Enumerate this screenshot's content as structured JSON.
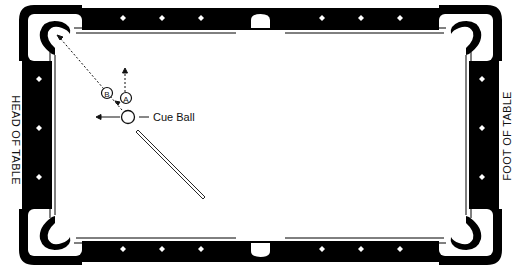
{
  "diagram": {
    "labels": {
      "head": "HEAD OF TABLE",
      "foot": "FOOT OF TABLE",
      "cue_ball": "Cue Ball",
      "point_a": "A",
      "point_b": "B"
    },
    "colors": {
      "rail": "#000000",
      "cloth": "#ffffff",
      "line": "#111111"
    },
    "diamonds": {
      "top": [
        123,
        162,
        201,
        322,
        361,
        400
      ],
      "bottom": [
        123,
        162,
        201,
        322,
        361,
        400
      ],
      "left": [
        79,
        128,
        177
      ],
      "right": [
        79,
        128,
        177
      ]
    }
  }
}
